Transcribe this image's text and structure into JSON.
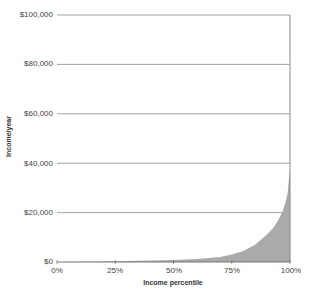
{
  "chart_data": {
    "type": "area",
    "title": "",
    "xlabel": "Income percentile",
    "ylabel": "Income/year",
    "x_ticks": [
      "0%",
      "25%",
      "50%",
      "75%",
      "100%"
    ],
    "y_ticks": [
      "$0",
      "$20,000",
      "$40,000",
      "$60,000",
      "$80,000",
      "$100,000"
    ],
    "xlim": [
      0,
      100
    ],
    "ylim": [
      0,
      100000
    ],
    "grid": "horizontal",
    "fill_color": "#aaaaaa",
    "x": [
      0,
      10,
      20,
      25,
      30,
      40,
      50,
      60,
      70,
      75,
      80,
      85,
      90,
      93,
      95,
      97,
      98,
      99,
      100
    ],
    "values": [
      0,
      150,
      250,
      300,
      400,
      600,
      800,
      1200,
      2000,
      3000,
      4500,
      7000,
      11000,
      14000,
      17000,
      21000,
      24000,
      28000,
      38000
    ]
  },
  "axes": {
    "y_tick_labels": [
      "$100,000",
      "$80,000",
      "$60,000",
      "$40,000",
      "$20,000",
      "$0"
    ],
    "x_tick_labels": [
      "0%",
      "25%",
      "50%",
      "75%",
      "100%"
    ],
    "y_title": "Income/year",
    "x_title": "Income percentile"
  }
}
